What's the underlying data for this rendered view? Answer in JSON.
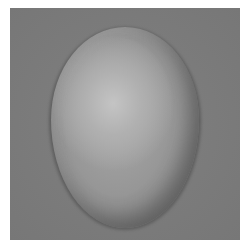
{
  "image": {
    "subject": "egg",
    "description": "Grayscale photograph of an egg on a gray background",
    "colors": {
      "border": "#ffffff",
      "background": "#7b7b7b",
      "egg_highlight": "#c4c4c4",
      "egg_midtone": "#969696",
      "egg_shadow": "#6e6e6e"
    }
  }
}
